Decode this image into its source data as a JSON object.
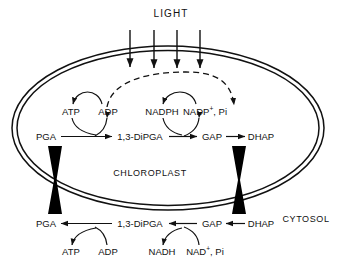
{
  "diagram": {
    "light_label": "LIGHT",
    "compartments": {
      "inner_label": "CHLOROPLAST",
      "outer_label": "CYTOSOL"
    },
    "colors": {
      "stroke": "#111111",
      "background": "#ffffff",
      "translocator_fill": "#000000"
    },
    "light_arrow_count": 4,
    "chloroplast_pathway": {
      "metabolites": [
        "PGA",
        "1,3-DiPGA",
        "GAP",
        "DHAP"
      ],
      "direction": "left-to-right",
      "cofactors_consumed": [
        "ATP",
        "NADPH"
      ],
      "cofactors_produced": [
        "ADP",
        "NADP",
        "Pi"
      ],
      "cofactor_labels": [
        "ATP",
        "ADP",
        "NADPH",
        "NADP",
        "Pi"
      ],
      "nadp_base": "NADP",
      "nadp_charge": "+",
      "nadp_tail": ", Pi"
    },
    "cytosol_pathway": {
      "metabolites": [
        "PGA",
        "1,3-DiPGA",
        "GAP",
        "DHAP"
      ],
      "direction": "right-to-left",
      "cofactor_labels": [
        "ATP",
        "ADP",
        "NADH",
        "NAD",
        "Pi"
      ],
      "nad_base": "NAD",
      "nad_charge": "+",
      "nad_tail": ", Pi"
    },
    "translocators": [
      {
        "name": "pga-translocator"
      },
      {
        "name": "dhap-translocator"
      }
    ]
  }
}
